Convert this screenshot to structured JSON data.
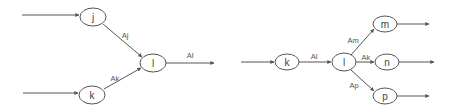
{
  "colors": {
    "line": "#555555",
    "text": "#444444",
    "background": "#ffffff"
  },
  "diagrams": [
    {
      "name": "merge",
      "nodes": [
        {
          "id": "j",
          "label": "j",
          "cx": 93,
          "cy": 17,
          "rx": 13,
          "ry": 9
        },
        {
          "id": "l",
          "label": "l",
          "cx": 153,
          "cy": 63,
          "rx": 13,
          "ry": 9
        },
        {
          "id": "k",
          "label": "k",
          "cx": 92,
          "cy": 95,
          "rx": 13,
          "ry": 9
        }
      ],
      "edges": [
        {
          "from": "input",
          "to": "j",
          "label": ""
        },
        {
          "from": "input",
          "to": "k",
          "label": ""
        },
        {
          "from": "j",
          "to": "l",
          "label": "Aj"
        },
        {
          "from": "k",
          "to": "l",
          "label": "Ak"
        },
        {
          "from": "l",
          "to": "output",
          "label": "Al"
        }
      ],
      "edge_labels": [
        {
          "text": "Aj",
          "x": 125,
          "y": 35
        },
        {
          "text": "Ak",
          "x": 115,
          "y": 77
        },
        {
          "text": "Al",
          "x": 190,
          "y": 55
        }
      ]
    },
    {
      "name": "split",
      "nodes": [
        {
          "id": "k",
          "label": "k",
          "cx": 287,
          "cy": 62,
          "rx": 12,
          "ry": 8
        },
        {
          "id": "l",
          "label": "l",
          "cx": 344,
          "cy": 62,
          "rx": 12,
          "ry": 9
        },
        {
          "id": "m",
          "label": "m",
          "cx": 385,
          "cy": 24,
          "rx": 12,
          "ry": 8
        },
        {
          "id": "n",
          "label": "n",
          "cx": 387,
          "cy": 62,
          "rx": 12,
          "ry": 8
        },
        {
          "id": "p",
          "label": "p",
          "cx": 385,
          "cy": 96,
          "rx": 12,
          "ry": 8
        }
      ],
      "edges": [
        {
          "from": "input",
          "to": "k",
          "label": ""
        },
        {
          "from": "k",
          "to": "l",
          "label": "Al"
        },
        {
          "from": "l",
          "to": "m",
          "label": "Am"
        },
        {
          "from": "l",
          "to": "n",
          "label": "Ak"
        },
        {
          "from": "l",
          "to": "p",
          "label": "Ap"
        },
        {
          "from": "m",
          "to": "output",
          "label": ""
        },
        {
          "from": "n",
          "to": "output",
          "label": ""
        },
        {
          "from": "p",
          "to": "output",
          "label": ""
        }
      ],
      "edge_labels": [
        {
          "text": "Al",
          "x": 314,
          "y": 56
        },
        {
          "text": "Am",
          "x": 353,
          "y": 41
        },
        {
          "text": "Ak",
          "x": 366,
          "y": 57
        },
        {
          "text": "Ap",
          "x": 354,
          "y": 85
        }
      ]
    }
  ],
  "labels": {
    "d1_node_j": "j",
    "d1_node_l": "l",
    "d1_node_k": "k",
    "d1_edge_aj": "Aj",
    "d1_edge_ak": "Ak",
    "d1_edge_al": "Al",
    "d2_node_k": "k",
    "d2_node_l": "l",
    "d2_node_m": "m",
    "d2_node_n": "n",
    "d2_node_p": "p",
    "d2_edge_al": "Al",
    "d2_edge_am": "Am",
    "d2_edge_ak": "Ak",
    "d2_edge_ap": "Ap"
  }
}
